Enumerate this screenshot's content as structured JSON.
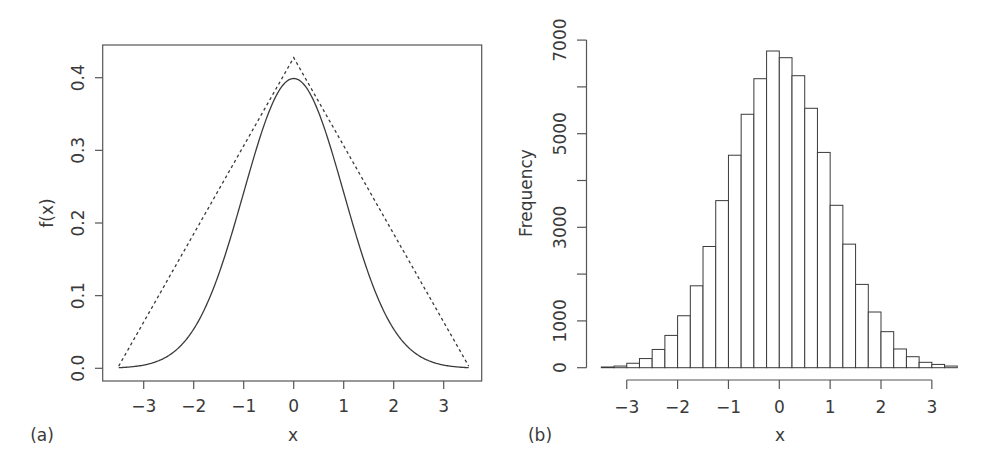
{
  "figure": {
    "panels": [
      {
        "id": "a",
        "label": "(a)",
        "xlabel": "x",
        "ylabel": "f(x)"
      },
      {
        "id": "b",
        "label": "(b)",
        "xlabel": "x",
        "ylabel": "Frequency"
      }
    ],
    "colors": {
      "line": "#3a3a3a",
      "axis": "#555555",
      "bar_fill": "#ffffff",
      "bar_stroke": "#3a3a3a",
      "text": "#3a3a3a"
    }
  },
  "chart_data": [
    {
      "type": "line",
      "panel": "(a)",
      "title": "",
      "xlabel": "x",
      "ylabel": "f(x)",
      "xlim": [
        -3.7,
        3.8
      ],
      "ylim": [
        -0.015,
        0.445
      ],
      "xticks": [
        -3,
        -2,
        -1,
        0,
        1,
        2,
        3
      ],
      "xtick_labels": [
        "−3",
        "−2",
        "−1",
        "0",
        "1",
        "2",
        "3"
      ],
      "yticks": [
        0.0,
        0.1,
        0.2,
        0.3,
        0.4
      ],
      "ytick_labels": [
        "0.0",
        "0.1",
        "0.2",
        "0.3",
        "0.4"
      ],
      "grid": false,
      "box": true,
      "series": [
        {
          "name": "standard normal density",
          "style": "solid",
          "function": "dnorm",
          "x_range": [
            -3.5,
            3.5
          ]
        },
        {
          "name": "triangular envelope",
          "style": "dashed",
          "x": [
            -3.5,
            0,
            3.5
          ],
          "y": [
            0.003,
            0.4276,
            0.003
          ]
        }
      ]
    },
    {
      "type": "bar",
      "subtype": "histogram",
      "panel": "(b)",
      "title": "",
      "xlabel": "x",
      "ylabel": "Frequency",
      "bin_width": 0.25,
      "bin_start": -3.5,
      "bin_end": 3.5,
      "xticks": [
        -3,
        -2,
        -1,
        0,
        1,
        2,
        3
      ],
      "xtick_labels": [
        "−3",
        "−2",
        "−1",
        "0",
        "1",
        "2",
        "3"
      ],
      "yticks": [
        0,
        1000,
        2000,
        3000,
        4000,
        5000,
        6000,
        7000
      ],
      "ytick_labels": [
        "0",
        "1000",
        "",
        "3000",
        "",
        "5000",
        "",
        "7000"
      ],
      "ylim": [
        0,
        7000
      ],
      "grid": false,
      "categories": [
        "-3.5",
        "-3.25",
        "-3",
        "-2.75",
        "-2.5",
        "-2.25",
        "-2",
        "-1.75",
        "-1.5",
        "-1.25",
        "-1",
        "-0.75",
        "-0.5",
        "-0.25",
        "0",
        "0.25",
        "0.5",
        "0.75",
        "1",
        "1.25",
        "1.5",
        "1.75",
        "2",
        "2.25",
        "2.5",
        "2.75",
        "3",
        "3.25"
      ],
      "values": [
        15,
        35,
        95,
        195,
        390,
        690,
        1110,
        1750,
        2590,
        3570,
        4540,
        5415,
        6175,
        6767,
        6624,
        6239,
        5543,
        4600,
        3470,
        2640,
        1780,
        1190,
        770,
        400,
        235,
        115,
        70,
        35
      ]
    }
  ]
}
